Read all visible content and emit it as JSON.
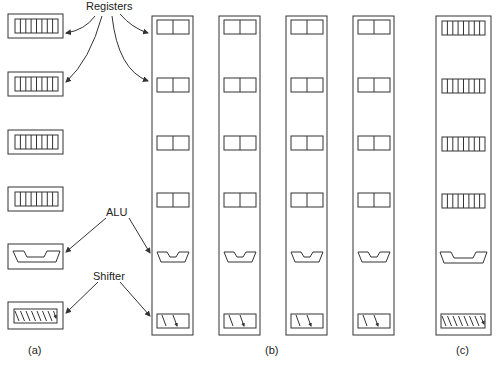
{
  "labels": {
    "registers": "Registers",
    "alu": "ALU",
    "shifter": "Shifter",
    "panel_a": "(a)",
    "panel_b": "(b)",
    "panel_c": "(c)"
  },
  "panels": {
    "a": {
      "description": "Separate units, each 8 bits wide",
      "register_count": 4,
      "register_bit_slices": 8,
      "alu_width": "wide",
      "shifter_bit_slices": 8
    },
    "b": {
      "description": "Four bit-sliced columns, each 2 bits wide",
      "column_count": 4,
      "register_count_per_column": 4,
      "register_bit_slices": 2,
      "alu_width": "narrow",
      "shifter_bit_slices": 2
    },
    "c": {
      "description": "Single 8-bit column",
      "column_count": 1,
      "register_count": 4,
      "register_bit_slices": 8,
      "alu_width": "wide",
      "shifter_bit_slices": 8
    }
  },
  "colors": {
    "stroke": "#333333",
    "background": "#ffffff"
  }
}
